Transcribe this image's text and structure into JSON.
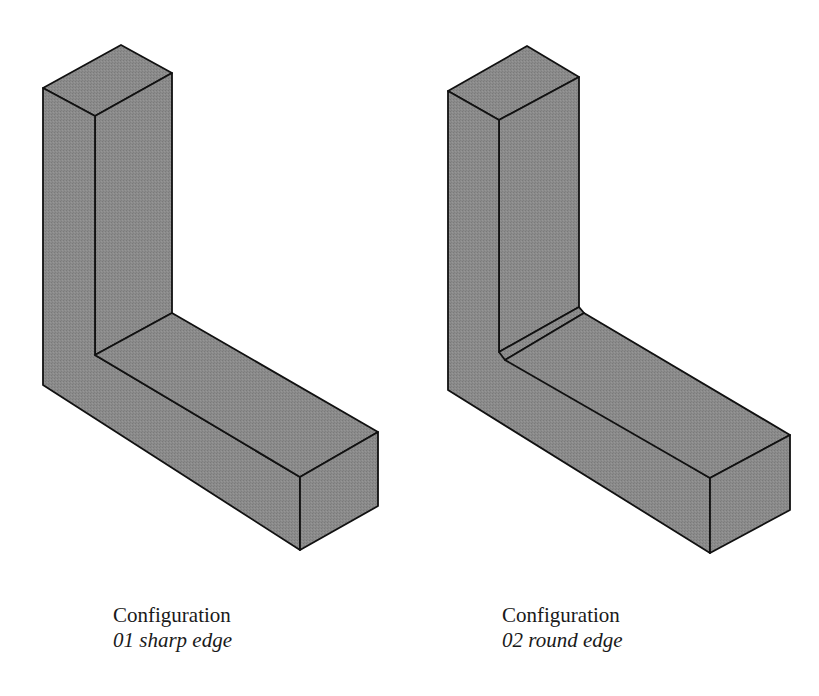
{
  "figure": {
    "fill_color": "#8a8a8a",
    "stroke_color": "#111111",
    "configurations": [
      {
        "id": "01",
        "caption_title": "Configuration",
        "caption_sub": "01 sharp edge",
        "edge_type": "sharp"
      },
      {
        "id": "02",
        "caption_title": "Configuration",
        "caption_sub": "02 round edge",
        "edge_type": "round"
      }
    ]
  }
}
